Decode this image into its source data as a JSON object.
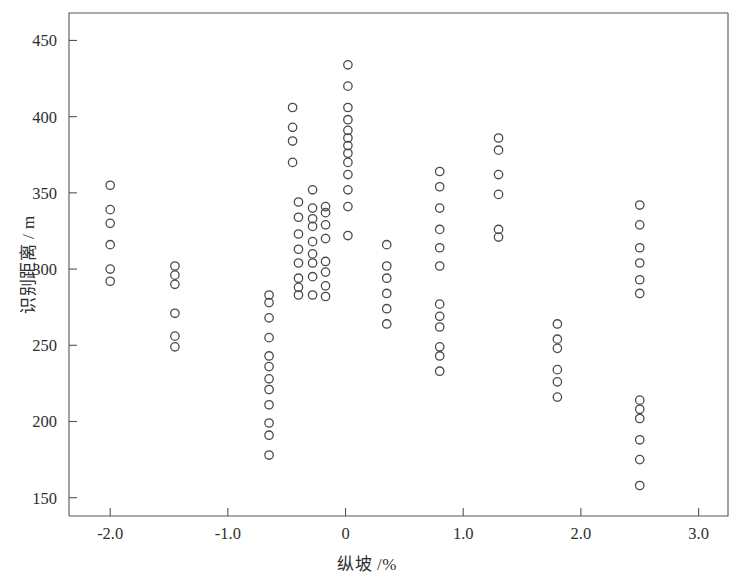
{
  "chart_data": {
    "type": "scatter",
    "title": "",
    "xlabel": "纵坡 /%",
    "ylabel": "识别距离 / m",
    "xlim": [
      -2.35,
      3.25
    ],
    "ylim": [
      138,
      468
    ],
    "xticks": [
      "-2.0",
      "-1.0",
      "0",
      "1.0",
      "2.0",
      "3.0"
    ],
    "xtick_values": [
      -2.0,
      -1.0,
      0,
      1.0,
      2.0,
      3.0
    ],
    "yticks": [
      "150",
      "200",
      "250",
      "300",
      "350",
      "400",
      "450"
    ],
    "ytick_values": [
      150,
      200,
      250,
      300,
      350,
      400,
      450
    ],
    "grid": false,
    "legend": null,
    "marker": "open-circle",
    "marker_color": "#4a4a4a",
    "points": [
      [
        -2.0,
        355
      ],
      [
        -2.0,
        339
      ],
      [
        -2.0,
        330
      ],
      [
        -2.0,
        316
      ],
      [
        -2.0,
        300
      ],
      [
        -2.0,
        292
      ],
      [
        -1.45,
        302
      ],
      [
        -1.45,
        296
      ],
      [
        -1.45,
        290
      ],
      [
        -1.45,
        271
      ],
      [
        -1.45,
        256
      ],
      [
        -1.45,
        249
      ],
      [
        -0.65,
        283
      ],
      [
        -0.65,
        278
      ],
      [
        -0.65,
        268
      ],
      [
        -0.65,
        255
      ],
      [
        -0.65,
        243
      ],
      [
        -0.65,
        236
      ],
      [
        -0.65,
        228
      ],
      [
        -0.65,
        221
      ],
      [
        -0.65,
        211
      ],
      [
        -0.65,
        199
      ],
      [
        -0.65,
        191
      ],
      [
        -0.65,
        178
      ],
      [
        -0.4,
        344
      ],
      [
        -0.4,
        334
      ],
      [
        -0.4,
        323
      ],
      [
        -0.4,
        313
      ],
      [
        -0.4,
        304
      ],
      [
        -0.4,
        294
      ],
      [
        -0.4,
        288
      ],
      [
        -0.4,
        283
      ],
      [
        -0.28,
        352
      ],
      [
        -0.28,
        340
      ],
      [
        -0.28,
        333
      ],
      [
        -0.28,
        328
      ],
      [
        -0.28,
        318
      ],
      [
        -0.28,
        310
      ],
      [
        -0.28,
        304
      ],
      [
        -0.28,
        295
      ],
      [
        -0.28,
        283
      ],
      [
        -0.17,
        341
      ],
      [
        -0.17,
        337
      ],
      [
        -0.17,
        329
      ],
      [
        -0.17,
        320
      ],
      [
        -0.17,
        305
      ],
      [
        -0.17,
        298
      ],
      [
        -0.17,
        289
      ],
      [
        -0.17,
        282
      ],
      [
        0.02,
        434
      ],
      [
        0.02,
        420
      ],
      [
        0.02,
        406
      ],
      [
        0.02,
        398
      ],
      [
        0.02,
        391
      ],
      [
        0.02,
        386
      ],
      [
        0.02,
        381
      ],
      [
        0.02,
        376
      ],
      [
        0.02,
        370
      ],
      [
        0.02,
        362
      ],
      [
        0.02,
        352
      ],
      [
        0.02,
        341
      ],
      [
        0.02,
        322
      ],
      [
        -0.45,
        406
      ],
      [
        -0.45,
        393
      ],
      [
        -0.45,
        384
      ],
      [
        -0.45,
        370
      ],
      [
        0.35,
        316
      ],
      [
        0.35,
        302
      ],
      [
        0.35,
        294
      ],
      [
        0.35,
        284
      ],
      [
        0.35,
        274
      ],
      [
        0.35,
        264
      ],
      [
        0.8,
        364
      ],
      [
        0.8,
        354
      ],
      [
        0.8,
        340
      ],
      [
        0.8,
        326
      ],
      [
        0.8,
        314
      ],
      [
        0.8,
        302
      ],
      [
        0.8,
        277
      ],
      [
        0.8,
        269
      ],
      [
        0.8,
        262
      ],
      [
        0.8,
        249
      ],
      [
        0.8,
        243
      ],
      [
        0.8,
        233
      ],
      [
        1.3,
        386
      ],
      [
        1.3,
        378
      ],
      [
        1.3,
        362
      ],
      [
        1.3,
        349
      ],
      [
        1.3,
        326
      ],
      [
        1.3,
        321
      ],
      [
        1.8,
        264
      ],
      [
        1.8,
        254
      ],
      [
        1.8,
        248
      ],
      [
        1.8,
        234
      ],
      [
        1.8,
        226
      ],
      [
        1.8,
        216
      ],
      [
        2.5,
        342
      ],
      [
        2.5,
        329
      ],
      [
        2.5,
        314
      ],
      [
        2.5,
        304
      ],
      [
        2.5,
        293
      ],
      [
        2.5,
        284
      ],
      [
        2.5,
        214
      ],
      [
        2.5,
        208
      ],
      [
        2.5,
        202
      ],
      [
        2.5,
        188
      ],
      [
        2.5,
        175
      ],
      [
        2.5,
        158
      ]
    ]
  }
}
